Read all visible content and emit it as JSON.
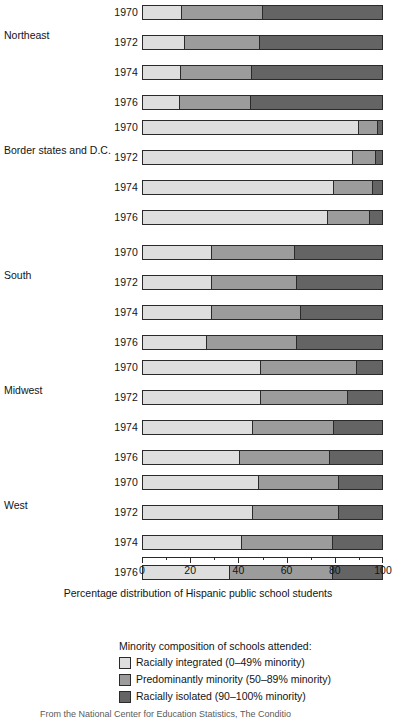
{
  "chart_data": {
    "type": "bar",
    "orientation": "horizontal",
    "stacked": true,
    "title": "",
    "xlabel": "Percentage distribution of Hispanic public school students",
    "ylabel": "",
    "xlim": [
      0,
      100
    ],
    "xticks": [
      0,
      20,
      40,
      60,
      80,
      100
    ],
    "xtick_labels": [
      "0",
      "20",
      "40",
      "60",
      "80",
      "100"
    ],
    "minor_ticks": [
      10,
      30,
      50,
      70,
      90
    ],
    "grid": false,
    "legend_position": "bottom",
    "legend_title": "Minority composition of schools attended:",
    "series": [
      {
        "name": "Racially integrated (0–49% minority)",
        "color": "#dedede"
      },
      {
        "name": "Predominantly minority (50–89% minority)",
        "color": "#9c9c9c"
      },
      {
        "name": "Racially isolated (90–100% minority)",
        "color": "#646464"
      }
    ],
    "categories": [
      "1970",
      "1972",
      "1974",
      "1976"
    ],
    "groups": [
      {
        "label": "Northeast",
        "rows": [
          {
            "year": "1970",
            "values": [
              16.0,
              33.7,
              50.3
            ]
          },
          {
            "year": "1972",
            "values": [
              17.0,
              31.4,
              51.6
            ]
          },
          {
            "year": "1974",
            "values": [
              15.5,
              29.5,
              55.0
            ]
          },
          {
            "year": "1976",
            "values": [
              15.0,
              29.8,
              55.2
            ]
          }
        ]
      },
      {
        "label": "Border states and D.C.",
        "rows": [
          {
            "year": "1970",
            "values": [
              89.8,
              8.2,
              2.0
            ]
          },
          {
            "year": "1972",
            "values": [
              87.4,
              9.6,
              3.0
            ]
          },
          {
            "year": "1974",
            "values": [
              79.7,
              16.0,
              4.3
            ]
          },
          {
            "year": "1976",
            "values": [
              77.0,
              17.6,
              5.4
            ]
          }
        ]
      },
      {
        "label": "South",
        "rows": [
          {
            "year": "1970",
            "values": [
              28.5,
              34.5,
              37.0
            ]
          },
          {
            "year": "1972",
            "values": [
              28.5,
              35.7,
              35.8
            ]
          },
          {
            "year": "1974",
            "values": [
              28.5,
              37.1,
              34.4
            ]
          },
          {
            "year": "1976",
            "values": [
              26.4,
              37.8,
              35.8
            ]
          }
        ]
      },
      {
        "label": "Midwest",
        "rows": [
          {
            "year": "1970",
            "values": [
              49.0,
              40.0,
              11.0
            ]
          },
          {
            "year": "1972",
            "values": [
              49.0,
              36.4,
              14.6
            ]
          },
          {
            "year": "1974",
            "values": [
              45.5,
              34.2,
              20.3
            ]
          },
          {
            "year": "1976",
            "values": [
              40.2,
              37.8,
              22.0
            ]
          }
        ]
      },
      {
        "label": "West",
        "rows": [
          {
            "year": "1970",
            "values": [
              48.2,
              33.5,
              18.3
            ]
          },
          {
            "year": "1972",
            "values": [
              45.7,
              36.0,
              18.3
            ]
          },
          {
            "year": "1974",
            "values": [
              41.0,
              38.0,
              21.0
            ]
          },
          {
            "year": "1976",
            "values": [
              35.8,
              43.2,
              21.0
            ]
          }
        ]
      }
    ]
  },
  "source_note": "From the National Center for Education Statistics, The Conditio"
}
